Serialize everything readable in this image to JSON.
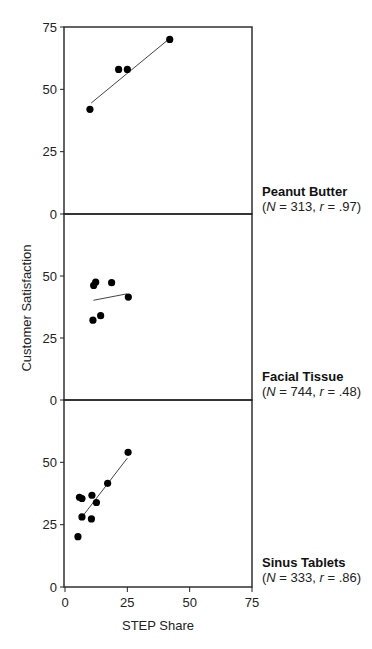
{
  "chart_data": {
    "type": "scatter",
    "layout": "three vertically stacked panels sharing x-axis",
    "xlabel": "STEP Share",
    "ylabel": "Customer Satisfaction",
    "xlim": [
      0,
      75
    ],
    "ylim": [
      0,
      75
    ],
    "xticks": [
      0,
      25,
      50,
      75
    ],
    "yticks": [
      0,
      25,
      50,
      75
    ],
    "grid": false,
    "legend": "none; panel labels at right",
    "panels": [
      {
        "name": "Peanut Butter",
        "stats": "(N = 313, r = .97)",
        "N": 313,
        "r": 0.97,
        "yticks": [
          0,
          25,
          50,
          75
        ],
        "points": [
          {
            "x": 10,
            "y": 42
          },
          {
            "x": 21.5,
            "y": 58
          },
          {
            "x": 25,
            "y": 58
          },
          {
            "x": 42,
            "y": 70
          }
        ],
        "fit_line": [
          {
            "x": 10.5,
            "y": 44.5
          },
          {
            "x": 41.5,
            "y": 70
          }
        ]
      },
      {
        "name": "Facial Tissue",
        "stats": "(N = 744, r = .48)",
        "N": 744,
        "r": 0.48,
        "yticks": [
          0,
          25,
          50
        ],
        "points": [
          {
            "x": 12.3,
            "y": 47.5
          },
          {
            "x": 11.5,
            "y": 46.2
          },
          {
            "x": 18.7,
            "y": 47.3
          },
          {
            "x": 25.4,
            "y": 41.5
          },
          {
            "x": 14.3,
            "y": 34
          },
          {
            "x": 11.2,
            "y": 32.2
          }
        ],
        "fit_line": [
          {
            "x": 11.4,
            "y": 40.2
          },
          {
            "x": 24.8,
            "y": 42.8
          }
        ]
      },
      {
        "name": "Sinus Tablets",
        "stats": "(N = 333, r = .86)",
        "N": 333,
        "r": 0.86,
        "yticks": [
          0,
          25,
          50
        ],
        "points": [
          {
            "x": 25.3,
            "y": 54
          },
          {
            "x": 17.1,
            "y": 41.6
          },
          {
            "x": 10.8,
            "y": 36.8
          },
          {
            "x": 5.8,
            "y": 36
          },
          {
            "x": 6.8,
            "y": 35.5
          },
          {
            "x": 12.6,
            "y": 33.9
          },
          {
            "x": 6.8,
            "y": 28.1
          },
          {
            "x": 10.6,
            "y": 27.3
          },
          {
            "x": 5.2,
            "y": 20.2
          }
        ],
        "fit_line": [
          {
            "x": 6,
            "y": 27
          },
          {
            "x": 25,
            "y": 51.7
          }
        ]
      }
    ]
  },
  "labels": {
    "ylabel": "Customer Satisfaction",
    "xlabel": "STEP Share",
    "panels": [
      {
        "title": "Peanut Butter",
        "n_label": "N",
        "n_value": " = 313, ",
        "r_label": "r",
        "r_value": " = .97)"
      },
      {
        "title": "Facial Tissue",
        "n_label": "N",
        "n_value": " = 744, ",
        "r_label": "r",
        "r_value": " = .48)"
      },
      {
        "title": "Sinus Tablets",
        "n_label": "N",
        "n_value": " = 333, ",
        "r_label": "r",
        "r_value": " = .86)"
      }
    ]
  },
  "colors": {
    "axis": "#222222",
    "point": "#000000",
    "fit_line": "#444444",
    "background": "#ffffff"
  }
}
